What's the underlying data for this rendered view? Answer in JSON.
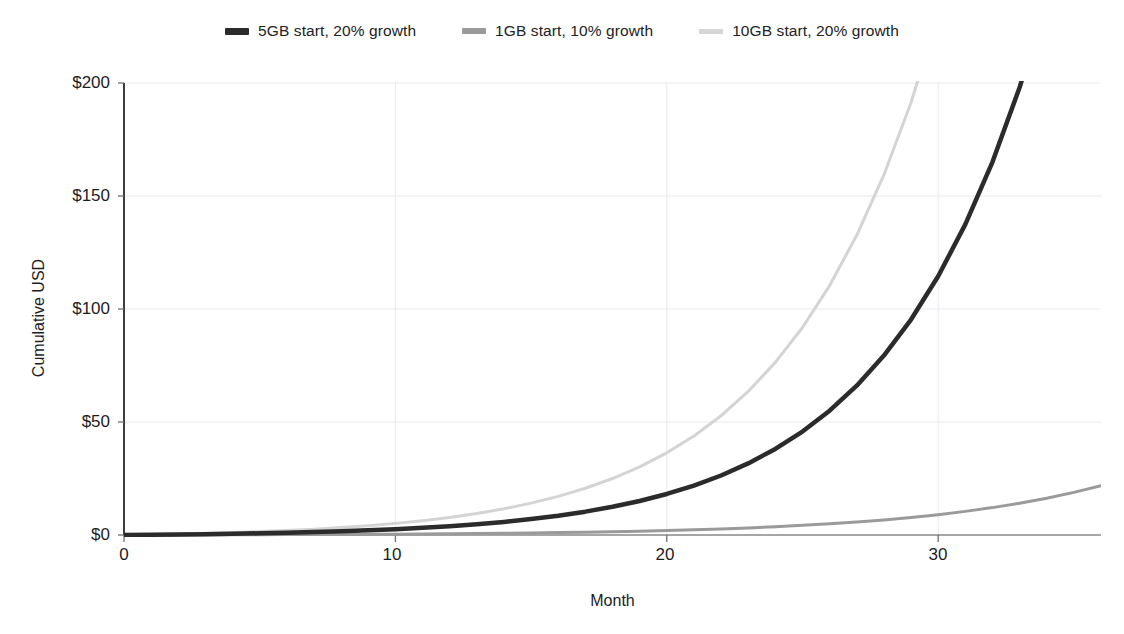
{
  "chart_data": {
    "type": "line",
    "title": "",
    "xlabel": "Month",
    "ylabel": "Cumulative USD",
    "xlim": [
      0,
      36
    ],
    "ylim": [
      0,
      200
    ],
    "grid": true,
    "legend_position": "top-center",
    "xticks": [
      0,
      10,
      20,
      30
    ],
    "xticklabels": [
      "0",
      "10",
      "20",
      "30"
    ],
    "yticks": [
      0,
      50,
      100,
      150,
      200
    ],
    "yticklabels": [
      "$0",
      "$50",
      "$100",
      "$150",
      "$200"
    ],
    "x": [
      0,
      1,
      2,
      3,
      4,
      5,
      6,
      7,
      8,
      9,
      10,
      11,
      12,
      13,
      14,
      15,
      16,
      17,
      18,
      19,
      20,
      21,
      22,
      23,
      24,
      25,
      26,
      27,
      28,
      29,
      30,
      31,
      32,
      33,
      34,
      35,
      36
    ],
    "series": [
      {
        "name": "5GB start, 20% growth",
        "color": "#2b2b2b",
        "width": 4.5,
        "values": [
          0,
          0.1,
          0.22,
          0.37,
          0.54,
          0.75,
          1.0,
          1.29,
          1.64,
          2.06,
          2.57,
          3.17,
          3.89,
          4.76,
          5.8,
          7.04,
          8.54,
          10.33,
          12.48,
          15.06,
          18.16,
          21.87,
          26.33,
          31.68,
          38.09,
          45.78,
          55.01,
          66.09,
          79.38,
          95.33,
          114.47,
          137.44,
          165,
          198,
          237,
          284,
          341
        ]
      },
      {
        "name": "1GB start, 10% growth",
        "color": "#9a9a9a",
        "width": 3,
        "values": [
          0,
          0.02,
          0.04,
          0.07,
          0.1,
          0.13,
          0.17,
          0.21,
          0.26,
          0.32,
          0.38,
          0.46,
          0.55,
          0.65,
          0.77,
          0.91,
          1.07,
          1.25,
          1.46,
          1.71,
          2.0,
          2.33,
          2.71,
          3.15,
          3.66,
          4.26,
          4.95,
          5.75,
          6.68,
          7.76,
          9.01,
          10.45,
          12.12,
          14.06,
          16.29,
          18.86,
          21.82
        ]
      },
      {
        "name": "10GB start, 20% growth",
        "color": "#d4d4d4",
        "width": 3,
        "values": [
          0,
          0.2,
          0.44,
          0.73,
          1.08,
          1.5,
          2.0,
          2.59,
          3.3,
          4.14,
          5.14,
          6.34,
          7.78,
          9.51,
          11.6,
          14.1,
          17.09,
          20.68,
          24.99,
          30.16,
          36.37,
          43.82,
          52.76,
          63.5,
          76.38,
          91.83,
          110.37,
          132.62,
          159.32,
          191.36,
          229.8,
          275.92,
          331.26,
          397.7,
          477.42,
          573.08,
          687.8
        ]
      }
    ]
  },
  "legend": {
    "items": [
      {
        "label": "5GB start, 20% growth",
        "color": "#2b2b2b",
        "swatch_height": 7
      },
      {
        "label": "1GB start, 10% growth",
        "color": "#9a9a9a",
        "swatch_height": 6
      },
      {
        "label": "10GB start, 20% growth",
        "color": "#d6d6d6",
        "swatch_height": 5
      }
    ]
  },
  "axes": {
    "y_title": "Cumulative USD",
    "x_title": "Month",
    "y_labels": [
      "$200",
      "$150",
      "$100",
      "$50",
      "$0"
    ],
    "x_labels": [
      "0",
      "10",
      "20",
      "30"
    ]
  },
  "colors": {
    "axis": "#4a4a4a",
    "grid": "#e9e9ee",
    "text": "#1d1d1d",
    "background": "#ffffff"
  }
}
